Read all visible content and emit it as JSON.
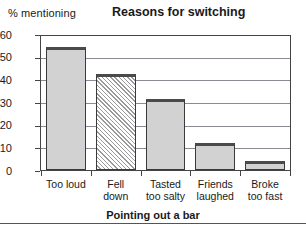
{
  "chart_data": {
    "type": "bar",
    "title": "Reasons for switching",
    "ylabel": "% mentioning",
    "xlabel": "",
    "categories": [
      "Too loud",
      "Fell down",
      "Tasted too salty",
      "Friends laughed",
      "Broke too fast"
    ],
    "category_lines": [
      {
        "line1": "Too loud",
        "line2": ""
      },
      {
        "line1": "Fell",
        "line2": "down"
      },
      {
        "line1": "Tasted",
        "line2": "too salty"
      },
      {
        "line1": "Friends",
        "line2": "laughed"
      },
      {
        "line1": "Broke",
        "line2": "too fast"
      }
    ],
    "values": [
      55,
      43,
      32,
      12,
      4
    ],
    "bar_styles": [
      "solid",
      "hatched",
      "solid",
      "solid",
      "solid"
    ],
    "ylim": [
      0,
      60
    ],
    "yticks": [
      0,
      10,
      20,
      30,
      40,
      50,
      60
    ],
    "ytick_labels": [
      "0",
      "10",
      "20",
      "30",
      "40",
      "50",
      "60"
    ],
    "grid": true,
    "legend": "none",
    "colors": {
      "bar_fill": "#d2d2d2",
      "bar_edge": "#3a3a3a",
      "grid": "#8a8a96",
      "frame": "#444444",
      "background": "#ffffff",
      "text": "#1a1a1a"
    }
  },
  "caption": {
    "text": "Pointing out a bar"
  }
}
